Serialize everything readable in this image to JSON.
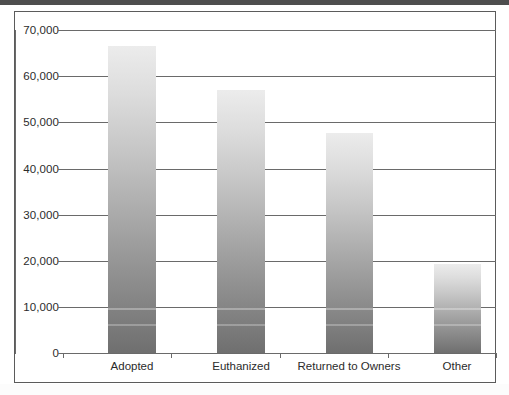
{
  "chart_data": {
    "type": "bar",
    "title": "",
    "subtitle": "",
    "xlabel": "",
    "ylabel": "",
    "categories": [
      "Adopted",
      "Euthanized",
      "Returned to Owners",
      "Other"
    ],
    "values": [
      66500,
      57000,
      47700,
      19200
    ],
    "series": [
      {
        "name": "Animal Outcomes",
        "values": [
          66500,
          57000,
          47700,
          19200
        ]
      }
    ],
    "ylim": [
      0,
      70000
    ],
    "ytick_values": [
      0,
      10000,
      20000,
      30000,
      40000,
      50000,
      60000,
      70000
    ],
    "ytick_labels": [
      "0",
      "10,000",
      "20,000",
      "30,000",
      "40,000",
      "50,000",
      "60,000",
      "70,000"
    ],
    "grid": "horizontal",
    "legend": "none",
    "bar_fill": "vertical-gradient-light-to-dark-gray",
    "bar_color_top": "#ececec",
    "bar_color_bottom": "#6f6f6f",
    "axis_color": "#6a6a6a",
    "frame_color": "#5b5b5b",
    "background": "#ffffff",
    "annotations": []
  }
}
